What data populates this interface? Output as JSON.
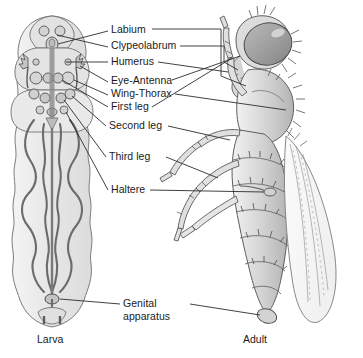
{
  "figure": {
    "background_color": "#ffffff",
    "ink_color": "#3a3a3a",
    "text_color": "#1a1a1a",
    "fill_light": "#e8e8e8",
    "fill_mid": "#c9c9c9",
    "fill_dark": "#a8a8a8"
  },
  "labels": [
    {
      "id": "labium",
      "text": "Labium"
    },
    {
      "id": "clypeolabrum",
      "text": "Clypeolabrum"
    },
    {
      "id": "humerus",
      "text": "Humerus"
    },
    {
      "id": "eye-antenna",
      "text": "Eye-Antenna"
    },
    {
      "id": "wing-thorax",
      "text": "Wing-Thorax"
    },
    {
      "id": "first-leg",
      "text": "First leg"
    },
    {
      "id": "second-leg",
      "text": "Second leg"
    },
    {
      "id": "third-leg",
      "text": "Third leg"
    },
    {
      "id": "haltere",
      "text": "Haltere"
    },
    {
      "id": "genital-apparatus",
      "text": "Genital apparatus"
    }
  ],
  "captions": {
    "left": "Larva",
    "right": "Adult"
  }
}
